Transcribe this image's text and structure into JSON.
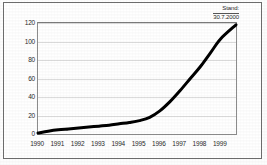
{
  "figure": {
    "name": "line-chart-figure",
    "background_color": "#ffffff",
    "frame_color": "#6e6e6e"
  },
  "annotation": {
    "line1": "Stand:",
    "line2": "30.7.2000"
  },
  "chart_data": {
    "type": "line",
    "title": "",
    "subtitle": "",
    "xlabel": "",
    "ylabel": "",
    "annotations": [
      "Stand:",
      "30.7.2000"
    ],
    "legend": [],
    "legend_position": "none",
    "grid": true,
    "grid_axis": "y",
    "line_color": "#000000",
    "line_width_px": 3,
    "xlim": [
      1990,
      1999.75
    ],
    "ylim": [
      0,
      120
    ],
    "ytick_labels": [
      "0",
      "20",
      "40",
      "60",
      "80",
      "100",
      "120"
    ],
    "ytick_values": [
      0,
      20,
      40,
      60,
      80,
      100,
      120
    ],
    "xtick_labels": [
      "1990",
      "1991",
      "1992",
      "1993",
      "1994",
      "1995",
      "1996",
      "1997",
      "1998",
      "1999"
    ],
    "xtick_values": [
      1990,
      1991,
      1992,
      1993,
      1994,
      1995,
      1996,
      1997,
      1998,
      1999
    ],
    "x": [
      1990,
      1990.5,
      1991,
      1991.5,
      1992,
      1992.5,
      1993,
      1993.5,
      1994,
      1994.5,
      1995,
      1995.5,
      1996,
      1996.5,
      1997,
      1997.5,
      1998,
      1998.5,
      1999,
      1999.75
    ],
    "values": [
      1,
      3,
      4.5,
      5.5,
      6.5,
      7.5,
      8.5,
      9.5,
      11,
      12.5,
      14.5,
      18,
      25,
      35,
      47,
      60,
      73,
      88,
      103,
      118
    ],
    "series": [
      {
        "name": "",
        "values": [
          1,
          3,
          4.5,
          5.5,
          6.5,
          7.5,
          8.5,
          9.5,
          11,
          12.5,
          14.5,
          18,
          25,
          35,
          47,
          60,
          73,
          88,
          103,
          118
        ]
      }
    ]
  }
}
